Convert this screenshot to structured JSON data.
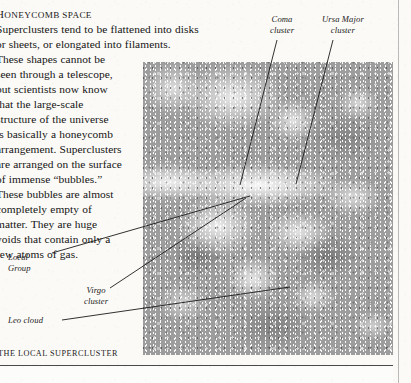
{
  "page": {
    "heading": "Honeycomb space",
    "body_lines": [
      "Superclusters tend to be flattened into disks",
      "or sheets, or elongated into filaments.",
      "These shapes cannot be",
      "seen through a telescope,",
      "but scientists now know",
      "that the large-scale",
      "structure of the universe",
      "is basically a honeycomb",
      "arrangement. Superclusters",
      "are arranged on the surface",
      "of immense “bubbles.”",
      "These bubbles are almost",
      "completely empty of",
      "matter. They are huge",
      "voids that contain only a",
      "few atoms of gas."
    ],
    "caption": "The Local Supercluster"
  },
  "annotations": [
    {
      "id": "coma",
      "line1": "Coma",
      "line2": "cluster"
    },
    {
      "id": "ursa",
      "line1": "Ursa Major",
      "line2": "cluster"
    },
    {
      "id": "local",
      "line1": "Local",
      "line2": "Group"
    },
    {
      "id": "virgo",
      "line1": "Virgo",
      "line2": "cluster"
    },
    {
      "id": "leo",
      "line1": "Leo cloud",
      "line2": ""
    }
  ],
  "plate": {
    "alt": "grayscale astronomical map of the local supercluster showing galaxy filaments and voids",
    "background_color": "#9d9d9d",
    "ink_color": "#1b1b1b"
  },
  "rules": {
    "horizontal_color": "#4a4a4a",
    "vertical_color": "#b9b9b9"
  }
}
